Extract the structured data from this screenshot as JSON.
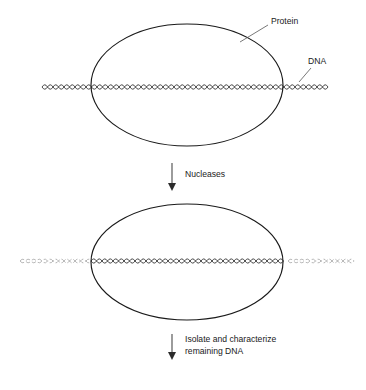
{
  "figure": {
    "background_color": "#ffffff",
    "line_color": "#1a1a1a",
    "faded_dna_color": "#9a9a9a"
  },
  "labels": {
    "protein": "Protein",
    "dna": "DNA",
    "nucleases": "Nucleases",
    "isolate_line1": "Isolate and characterize",
    "isolate_line2": "remaining DNA"
  },
  "panels": [
    {
      "name": "before-digestion",
      "protein_shape": "ellipse",
      "dna_state": "intact",
      "dna_span": "full-width",
      "ellipse": {
        "cx": 187,
        "cy": 85,
        "rx": 96,
        "ry": 61
      },
      "dna_y": 87
    },
    {
      "name": "after-digestion",
      "protein_shape": "ellipse",
      "dna_state": "digested-outside-protected-inside",
      "dna_span": "protected-region-solid",
      "ellipse": {
        "cx": 187,
        "cy": 262,
        "rx": 96,
        "ry": 58
      },
      "dna_y": 261
    }
  ],
  "arrows": [
    {
      "name": "nucleases-arrow",
      "x": 172,
      "y_start": 163,
      "y_end": 190,
      "label": "Nucleases"
    },
    {
      "name": "isolate-arrow",
      "x": 172,
      "y_start": 334,
      "y_end": 360,
      "label": "Isolate and characterize remaining DNA"
    }
  ],
  "icons": {
    "arrow_down": "arrow-down-icon",
    "leader_line": "leader-line-icon"
  }
}
